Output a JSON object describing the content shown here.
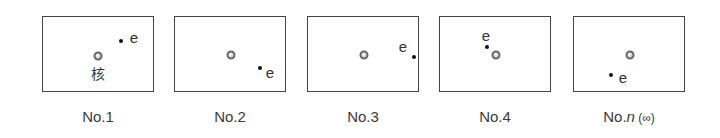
{
  "diagram": {
    "title": "",
    "nucleus_label": "核",
    "electron_label": "e",
    "panels": [
      {
        "caption": "No.1",
        "caption_italic": "",
        "caption_suffix": "",
        "left": 42,
        "nucleus": [
          55,
          39
        ],
        "electron": [
          78,
          24
        ],
        "e_label": [
          91,
          20
        ],
        "has_nucleus_label": true,
        "nucleus_label_pos": [
          55,
          57
        ]
      },
      {
        "caption": "No.2",
        "caption_italic": "",
        "caption_suffix": "",
        "left": 174,
        "nucleus": [
          56,
          38
        ],
        "electron": [
          85,
          51
        ],
        "e_label": [
          95,
          55
        ],
        "has_nucleus_label": false
      },
      {
        "caption": "No.3",
        "caption_italic": "",
        "caption_suffix": "",
        "left": 307,
        "nucleus": [
          56,
          38
        ],
        "electron": [
          106,
          40
        ],
        "e_label": [
          95,
          29
        ],
        "has_nucleus_label": false
      },
      {
        "caption": "No.4",
        "caption_italic": "",
        "caption_suffix": "",
        "left": 439,
        "nucleus": [
          56,
          38
        ],
        "electron": [
          47,
          30
        ],
        "e_label": [
          46,
          18
        ],
        "has_nucleus_label": false
      },
      {
        "caption": "No.",
        "caption_italic": "n",
        "caption_suffix": "(∞)",
        "left": 573,
        "nucleus": [
          56,
          38
        ],
        "electron": [
          37,
          58
        ],
        "e_label": [
          49,
          60
        ],
        "has_nucleus_label": false
      }
    ]
  }
}
